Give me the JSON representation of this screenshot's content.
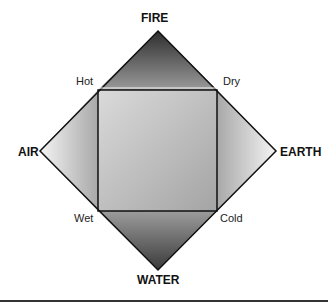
{
  "diagram": {
    "elements": {
      "top": "FIRE",
      "left": "AIR",
      "right": "EARTH",
      "bottom": "WATER"
    },
    "qualities": {
      "top_left": "Hot",
      "top_right": "Dry",
      "bottom_left": "Wet",
      "bottom_right": "Cold"
    },
    "colors": {
      "outline": "#111111",
      "fire_dark": "#3a3a3a",
      "water_dark": "#404040",
      "light": "#ededed",
      "square_mid": "#b5b5b5"
    }
  }
}
